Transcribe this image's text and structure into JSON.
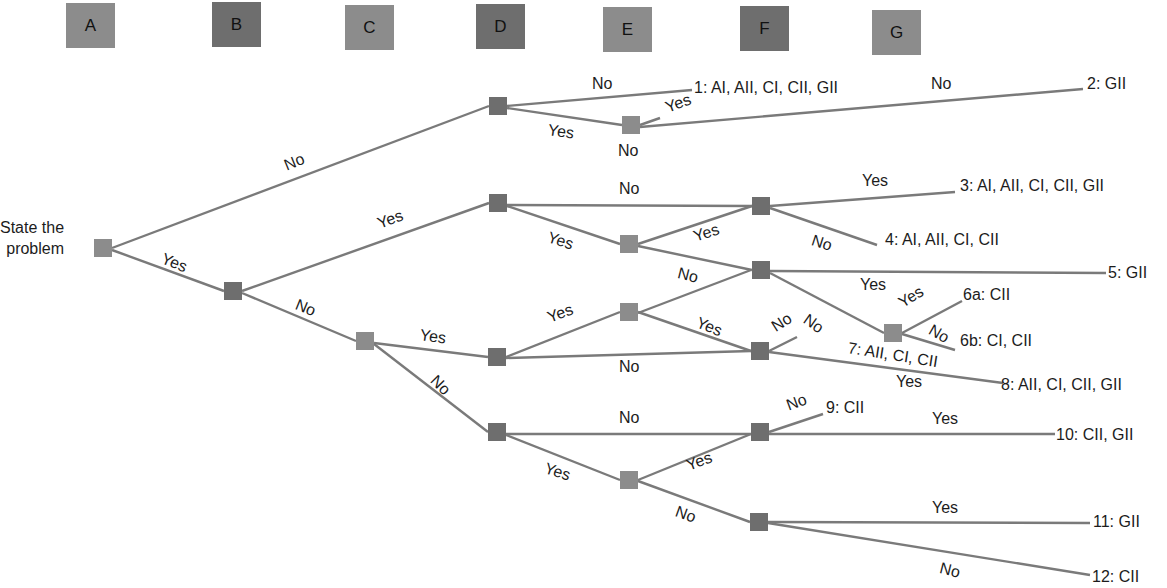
{
  "header_columns": [
    {
      "letter": "A",
      "x": 66,
      "y": 3,
      "color": "#8c8c8c"
    },
    {
      "letter": "B",
      "x": 212,
      "y": 2,
      "color": "#6e6e6e"
    },
    {
      "letter": "C",
      "x": 345,
      "y": 5,
      "color": "#8c8c8c"
    },
    {
      "letter": "D",
      "x": 476,
      "y": 4,
      "color": "#6e6e6e"
    },
    {
      "letter": "E",
      "x": 603,
      "y": 7,
      "color": "#8c8c8c"
    },
    {
      "letter": "F",
      "x": 740,
      "y": 6,
      "color": "#6e6e6e"
    },
    {
      "letter": "G",
      "x": 872,
      "y": 10,
      "color": "#8c8c8c"
    }
  ],
  "start_label": "State the\nproblem",
  "colors": {
    "edge": "#7a7a7a",
    "node_light": "#8c8c8c",
    "node_dark": "#6e6e6e"
  },
  "nodes": [
    {
      "id": "root",
      "x": 103,
      "y": 248,
      "shade": "light"
    },
    {
      "id": "B1",
      "x": 233,
      "y": 291,
      "shade": "dark"
    },
    {
      "id": "D1",
      "x": 498,
      "y": 106,
      "shade": "dark"
    },
    {
      "id": "E1",
      "x": 631,
      "y": 125,
      "shade": "light"
    },
    {
      "id": "D2",
      "x": 498,
      "y": 203,
      "shade": "dark"
    },
    {
      "id": "E2",
      "x": 629,
      "y": 244,
      "shade": "light"
    },
    {
      "id": "F1",
      "x": 761,
      "y": 206,
      "shade": "dark"
    },
    {
      "id": "F2",
      "x": 761,
      "y": 270,
      "shade": "dark"
    },
    {
      "id": "C1",
      "x": 365,
      "y": 341,
      "shade": "light"
    },
    {
      "id": "D3",
      "x": 497,
      "y": 357,
      "shade": "dark"
    },
    {
      "id": "E3",
      "x": 629,
      "y": 312,
      "shade": "light"
    },
    {
      "id": "F3",
      "x": 760,
      "y": 351,
      "shade": "dark"
    },
    {
      "id": "G1",
      "x": 893,
      "y": 333,
      "shade": "light"
    },
    {
      "id": "D4",
      "x": 497,
      "y": 432,
      "shade": "dark"
    },
    {
      "id": "E4",
      "x": 629,
      "y": 480,
      "shade": "light"
    },
    {
      "id": "F4",
      "x": 760,
      "y": 432,
      "shade": "dark"
    },
    {
      "id": "F5",
      "x": 759,
      "y": 522,
      "shade": "dark"
    }
  ],
  "edges": [
    {
      "x1": 112,
      "y1": 248,
      "x2": 489,
      "y2": 106
    },
    {
      "x1": 112,
      "y1": 250,
      "x2": 224,
      "y2": 291
    },
    {
      "x1": 242,
      "y1": 291,
      "x2": 489,
      "y2": 203
    },
    {
      "x1": 242,
      "y1": 293,
      "x2": 356,
      "y2": 341
    },
    {
      "x1": 507,
      "y1": 106,
      "x2": 692,
      "y2": 90
    },
    {
      "x1": 507,
      "y1": 108,
      "x2": 622,
      "y2": 125
    },
    {
      "x1": 640,
      "y1": 125,
      "x2": 660,
      "y2": 118
    },
    {
      "x1": 640,
      "y1": 127,
      "x2": 1083,
      "y2": 89
    },
    {
      "x1": 507,
      "y1": 205,
      "x2": 752,
      "y2": 206
    },
    {
      "x1": 507,
      "y1": 206,
      "x2": 620,
      "y2": 244
    },
    {
      "x1": 638,
      "y1": 244,
      "x2": 752,
      "y2": 206
    },
    {
      "x1": 638,
      "y1": 246,
      "x2": 752,
      "y2": 270
    },
    {
      "x1": 770,
      "y1": 206,
      "x2": 955,
      "y2": 192
    },
    {
      "x1": 770,
      "y1": 208,
      "x2": 877,
      "y2": 245
    },
    {
      "x1": 770,
      "y1": 271,
      "x2": 1106,
      "y2": 273
    },
    {
      "x1": 770,
      "y1": 273,
      "x2": 884,
      "y2": 333
    },
    {
      "x1": 902,
      "y1": 333,
      "x2": 962,
      "y2": 301
    },
    {
      "x1": 902,
      "y1": 334,
      "x2": 955,
      "y2": 350
    },
    {
      "x1": 374,
      "y1": 343,
      "x2": 488,
      "y2": 357
    },
    {
      "x1": 374,
      "y1": 344,
      "x2": 488,
      "y2": 432
    },
    {
      "x1": 506,
      "y1": 357,
      "x2": 620,
      "y2": 312
    },
    {
      "x1": 506,
      "y1": 358,
      "x2": 751,
      "y2": 351
    },
    {
      "x1": 638,
      "y1": 312,
      "x2": 751,
      "y2": 351
    },
    {
      "x1": 638,
      "y1": 313,
      "x2": 751,
      "y2": 270
    },
    {
      "x1": 769,
      "y1": 351,
      "x2": 797,
      "y2": 337
    },
    {
      "x1": 769,
      "y1": 352,
      "x2": 1003,
      "y2": 383
    },
    {
      "x1": 506,
      "y1": 434,
      "x2": 751,
      "y2": 434
    },
    {
      "x1": 506,
      "y1": 435,
      "x2": 620,
      "y2": 480
    },
    {
      "x1": 638,
      "y1": 480,
      "x2": 751,
      "y2": 434
    },
    {
      "x1": 638,
      "y1": 481,
      "x2": 750,
      "y2": 522
    },
    {
      "x1": 769,
      "y1": 432,
      "x2": 823,
      "y2": 414
    },
    {
      "x1": 769,
      "y1": 434,
      "x2": 1055,
      "y2": 434
    },
    {
      "x1": 768,
      "y1": 522,
      "x2": 1090,
      "y2": 523
    },
    {
      "x1": 768,
      "y1": 523,
      "x2": 1090,
      "y2": 575
    }
  ],
  "branch_labels": [
    {
      "text": "No",
      "x": 285,
      "y": 158,
      "rot": -22
    },
    {
      "text": "Yes",
      "x": 162,
      "y": 250,
      "rot": 22
    },
    {
      "text": "Yes",
      "x": 378,
      "y": 216,
      "rot": -20
    },
    {
      "text": "No",
      "x": 296,
      "y": 296,
      "rot": 22
    },
    {
      "text": "No",
      "x": 592,
      "y": 76,
      "rot": 0
    },
    {
      "text": "Yes",
      "x": 548,
      "y": 122,
      "rot": 8
    },
    {
      "text": "Yes",
      "x": 666,
      "y": 100,
      "rot": -20
    },
    {
      "text": "No",
      "x": 618,
      "y": 143,
      "rot": 0
    },
    {
      "text": "No",
      "x": 931,
      "y": 76,
      "rot": 0
    },
    {
      "text": "No",
      "x": 619,
      "y": 181,
      "rot": 0
    },
    {
      "text": "Yes",
      "x": 548,
      "y": 229,
      "rot": 18
    },
    {
      "text": "Yes",
      "x": 694,
      "y": 229,
      "rot": -18
    },
    {
      "text": "No",
      "x": 678,
      "y": 265,
      "rot": 14
    },
    {
      "text": "Yes",
      "x": 862,
      "y": 173,
      "rot": 0
    },
    {
      "text": "No",
      "x": 812,
      "y": 232,
      "rot": 18
    },
    {
      "text": "Yes",
      "x": 860,
      "y": 277,
      "rot": 0
    },
    {
      "text": "No",
      "x": 805,
      "y": 310,
      "rot": 35
    },
    {
      "text": "No",
      "x": 773,
      "y": 320,
      "rot": -32
    },
    {
      "text": "Yes",
      "x": 900,
      "y": 296,
      "rot": -32
    },
    {
      "text": "No",
      "x": 930,
      "y": 321,
      "rot": 30
    },
    {
      "text": "Yes",
      "x": 420,
      "y": 327,
      "rot": 8
    },
    {
      "text": "No",
      "x": 433,
      "y": 370,
      "rot": 45
    },
    {
      "text": "Yes",
      "x": 548,
      "y": 310,
      "rot": -20
    },
    {
      "text": "Yes",
      "x": 697,
      "y": 314,
      "rot": 22
    },
    {
      "text": "No",
      "x": 619,
      "y": 359,
      "rot": 0
    },
    {
      "text": "Yes",
      "x": 896,
      "y": 374,
      "rot": 0
    },
    {
      "text": "No",
      "x": 619,
      "y": 410,
      "rot": 0
    },
    {
      "text": "Yes",
      "x": 545,
      "y": 460,
      "rot": 18
    },
    {
      "text": "Yes",
      "x": 687,
      "y": 458,
      "rot": -20
    },
    {
      "text": "No",
      "x": 676,
      "y": 503,
      "rot": 20
    },
    {
      "text": "No",
      "x": 787,
      "y": 398,
      "rot": -20
    },
    {
      "text": "Yes",
      "x": 932,
      "y": 411,
      "rot": 0
    },
    {
      "text": "Yes",
      "x": 932,
      "y": 500,
      "rot": 0
    },
    {
      "text": "No",
      "x": 940,
      "y": 560,
      "rot": 14
    }
  ],
  "outcomes": [
    {
      "id": "1",
      "text": "1: AI, AII, CI, CII, GII",
      "x": 694,
      "y": 80,
      "rot": 0
    },
    {
      "id": "2",
      "text": "2: GII",
      "x": 1087,
      "y": 76,
      "rot": 0
    },
    {
      "id": "3",
      "text": "3: AI, AII, CI, CII, GII",
      "x": 960,
      "y": 178,
      "rot": 0
    },
    {
      "id": "4",
      "text": "4: AI, AII, CI, CII",
      "x": 885,
      "y": 232,
      "rot": 0
    },
    {
      "id": "5",
      "text": "5: GII",
      "x": 1108,
      "y": 265,
      "rot": 0
    },
    {
      "id": "6a",
      "text": "6a: CII",
      "x": 963,
      "y": 287,
      "rot": 0
    },
    {
      "id": "6b",
      "text": "6b: CI, CII",
      "x": 960,
      "y": 333,
      "rot": 0
    },
    {
      "id": "7",
      "text": "7: AII, CI, CII",
      "x": 848,
      "y": 340,
      "rot": 9
    },
    {
      "id": "8",
      "text": "8: AII, CI, CII, GII",
      "x": 1001,
      "y": 377,
      "rot": 0
    },
    {
      "id": "9",
      "text": "9: CII",
      "x": 826,
      "y": 400,
      "rot": 0
    },
    {
      "id": "10",
      "text": "10: CII, GII",
      "x": 1056,
      "y": 427,
      "rot": 0
    },
    {
      "id": "11",
      "text": "11: GII",
      "x": 1093,
      "y": 514,
      "rot": 0
    },
    {
      "id": "12",
      "text": "12: CII",
      "x": 1092,
      "y": 569,
      "rot": 0
    }
  ]
}
